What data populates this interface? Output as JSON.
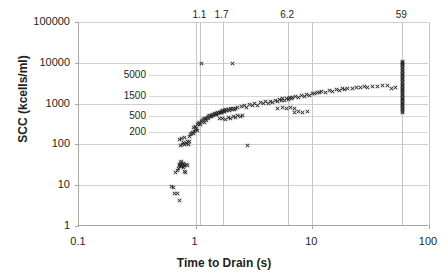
{
  "chart_data": {
    "type": "scatter",
    "title": "",
    "xlabel": "Time to Drain (s)",
    "ylabel": "SCC (kcells/ml)",
    "xscale": "log",
    "yscale": "log",
    "xlim": [
      0.1,
      100
    ],
    "ylim": [
      1,
      100000
    ],
    "grid": true,
    "legend": "none",
    "marker": "x",
    "marker_color": "#2b2b2b",
    "xticks": [
      "0.1",
      "1",
      "10",
      "100"
    ],
    "xtick_values": [
      0.1,
      1,
      10,
      100
    ],
    "yticks": [
      "1",
      "10",
      "100",
      "1000",
      "10000",
      "100000"
    ],
    "ytick_values": [
      1,
      10,
      100,
      1000,
      10000,
      100000
    ],
    "inner_y_reference_labels": [
      "200",
      "500",
      "1500",
      "5000"
    ],
    "inner_y_reference_values": [
      200,
      500,
      1500,
      5000
    ],
    "top_x_reference_labels": [
      "1.1",
      "1.7",
      "6.2",
      "59"
    ],
    "top_x_reference_values": [
      1.1,
      1.7,
      6.2,
      59
    ],
    "points": [
      [
        0.62,
        9.2
      ],
      [
        0.65,
        9.0
      ],
      [
        0.66,
        6.2
      ],
      [
        0.7,
        6.1
      ],
      [
        0.72,
        4.2
      ],
      [
        0.67,
        21.0
      ],
      [
        0.7,
        23.0
      ],
      [
        0.71,
        26.0
      ],
      [
        0.72,
        30.0
      ],
      [
        0.73,
        33.0
      ],
      [
        0.74,
        31.0
      ],
      [
        0.74,
        36.0
      ],
      [
        0.75,
        28.0
      ],
      [
        0.75,
        34.0
      ],
      [
        0.76,
        29.0
      ],
      [
        0.76,
        38.0
      ],
      [
        0.77,
        32.0
      ],
      [
        0.78,
        27.0
      ],
      [
        0.78,
        35.0
      ],
      [
        0.79,
        31.0
      ],
      [
        0.8,
        30.0
      ],
      [
        0.81,
        22.0
      ],
      [
        0.82,
        20.0
      ],
      [
        0.83,
        33.0
      ],
      [
        0.85,
        31.0
      ],
      [
        0.74,
        95.0
      ],
      [
        0.77,
        100.0
      ],
      [
        0.79,
        110.0
      ],
      [
        0.81,
        98.0
      ],
      [
        0.83,
        105.0
      ],
      [
        0.85,
        120.0
      ],
      [
        0.87,
        99.0
      ],
      [
        0.89,
        115.0
      ],
      [
        0.72,
        130.0
      ],
      [
        0.76,
        140.0
      ],
      [
        0.8,
        150.0
      ],
      [
        0.88,
        160.0
      ],
      [
        0.9,
        175.0
      ],
      [
        0.92,
        190.0
      ],
      [
        0.94,
        200.0
      ],
      [
        0.96,
        185.0
      ],
      [
        0.98,
        210.0
      ],
      [
        1.0,
        230.0
      ],
      [
        1.02,
        250.0
      ],
      [
        1.04,
        220.0
      ],
      [
        0.95,
        260.0
      ],
      [
        0.99,
        280.0
      ],
      [
        1.03,
        300.0
      ],
      [
        1.06,
        320.0
      ],
      [
        1.08,
        340.0
      ],
      [
        1.1,
        310.0
      ],
      [
        1.12,
        360.0
      ],
      [
        1.14,
        380.0
      ],
      [
        1.16,
        400.0
      ],
      [
        1.18,
        350.0
      ],
      [
        1.2,
        420.0
      ],
      [
        1.22,
        440.0
      ],
      [
        1.24,
        390.0
      ],
      [
        1.26,
        460.0
      ],
      [
        1.28,
        480.0
      ],
      [
        1.3,
        430.0
      ],
      [
        1.32,
        500.0
      ],
      [
        1.34,
        470.0
      ],
      [
        1.36,
        520.0
      ],
      [
        1.38,
        490.0
      ],
      [
        1.4,
        540.0
      ],
      [
        1.42,
        510.0
      ],
      [
        1.45,
        560.0
      ],
      [
        1.48,
        530.0
      ],
      [
        1.5,
        580.0
      ],
      [
        1.52,
        550.0
      ],
      [
        1.55,
        600.0
      ],
      [
        1.58,
        570.0
      ],
      [
        1.6,
        620.0
      ],
      [
        1.62,
        590.0
      ],
      [
        1.65,
        640.0
      ],
      [
        1.68,
        610.0
      ],
      [
        1.7,
        660.0
      ],
      [
        1.72,
        630.0
      ],
      [
        1.75,
        680.0
      ],
      [
        1.78,
        650.0
      ],
      [
        1.8,
        700.0
      ],
      [
        1.85,
        670.0
      ],
      [
        1.9,
        720.0
      ],
      [
        1.95,
        690.0
      ],
      [
        2.0,
        740.0
      ],
      [
        2.05,
        710.0
      ],
      [
        2.1,
        760.0
      ],
      [
        2.15,
        730.0
      ],
      [
        2.2,
        780.0
      ],
      [
        1.6,
        420.0
      ],
      [
        1.7,
        440.0
      ],
      [
        1.8,
        400.0
      ],
      [
        1.9,
        460.0
      ],
      [
        2.0,
        430.0
      ],
      [
        2.1,
        480.0
      ],
      [
        2.2,
        450.0
      ],
      [
        2.3,
        500.0
      ],
      [
        2.4,
        470.0
      ],
      [
        2.5,
        520.0
      ],
      [
        2.3,
        800.0
      ],
      [
        2.45,
        850.0
      ],
      [
        2.6,
        900.0
      ],
      [
        2.75,
        820.0
      ],
      [
        2.9,
        950.0
      ],
      [
        3.05,
        880.0
      ],
      [
        3.2,
        1000.0
      ],
      [
        3.4,
        920.0
      ],
      [
        3.6,
        1050.0
      ],
      [
        3.8,
        980.0
      ],
      [
        4.0,
        1100.0
      ],
      [
        4.2,
        1020.0
      ],
      [
        4.4,
        1150.0
      ],
      [
        4.6,
        1080.0
      ],
      [
        4.8,
        1200.0
      ],
      [
        5.0,
        1120.0
      ],
      [
        5.2,
        1250.0
      ],
      [
        5.4,
        1180.0
      ],
      [
        5.6,
        1300.0
      ],
      [
        5.8,
        1220.0
      ],
      [
        6.0,
        1350.0
      ],
      [
        6.2,
        1280.0
      ],
      [
        6.4,
        1400.0
      ],
      [
        6.6,
        1330.0
      ],
      [
        6.8,
        1450.0
      ],
      [
        5.0,
        760.0
      ],
      [
        5.5,
        800.0
      ],
      [
        6.0,
        740.0
      ],
      [
        6.5,
        820.0
      ],
      [
        7.0,
        780.0
      ],
      [
        7.2,
        1500.0
      ],
      [
        7.6,
        1420.0
      ],
      [
        8.0,
        1600.0
      ],
      [
        8.5,
        1520.0
      ],
      [
        9.0,
        1700.0
      ],
      [
        9.5,
        1620.0
      ],
      [
        10.0,
        1800.0
      ],
      [
        10.5,
        1720.0
      ],
      [
        11.0,
        1900.0
      ],
      [
        11.5,
        1820.0
      ],
      [
        12.0,
        2000.0
      ],
      [
        13.0,
        1920.0
      ],
      [
        14.0,
        2100.0
      ],
      [
        15.0,
        2020.0
      ],
      [
        16.0,
        2200.0
      ],
      [
        17.0,
        2120.0
      ],
      [
        18.0,
        2300.0
      ],
      [
        19.0,
        2220.0
      ],
      [
        20.0,
        2400.0
      ],
      [
        22.0,
        2320.0
      ],
      [
        24.0,
        2500.0
      ],
      [
        26.0,
        2420.0
      ],
      [
        28.0,
        2600.0
      ],
      [
        30.0,
        2520.0
      ],
      [
        33.0,
        2700.0
      ],
      [
        36.0,
        2620.0
      ],
      [
        40.0,
        2800.0
      ],
      [
        44.0,
        2720.0
      ],
      [
        48.0,
        2400.0
      ],
      [
        52.0,
        2450.0
      ],
      [
        2.05,
        9500.0
      ],
      [
        1.12,
        9800.0
      ],
      [
        2.8,
        95.0
      ],
      [
        7.0,
        620.0
      ],
      [
        7.6,
        640.0
      ],
      [
        8.3,
        610.0
      ],
      [
        9.1,
        650.0
      ],
      [
        59.0,
        7800.0
      ],
      [
        59.0,
        7200.0
      ],
      [
        59.0,
        6600.0
      ],
      [
        59.0,
        6100.0
      ],
      [
        59.0,
        5600.0
      ],
      [
        59.0,
        5200.0
      ],
      [
        59.0,
        4800.0
      ],
      [
        59.0,
        4400.0
      ],
      [
        59.0,
        4100.0
      ],
      [
        59.0,
        3800.0
      ],
      [
        59.0,
        3500.0
      ],
      [
        59.0,
        3200.0
      ],
      [
        59.0,
        3000.0
      ],
      [
        59.0,
        2800.0
      ],
      [
        59.0,
        2600.0
      ],
      [
        59.0,
        2400.0
      ],
      [
        59.0,
        2250.0
      ],
      [
        59.0,
        2100.0
      ],
      [
        59.0,
        1950.0
      ],
      [
        59.0,
        1800.0
      ],
      [
        59.0,
        1680.0
      ],
      [
        59.0,
        1560.0
      ],
      [
        59.0,
        1450.0
      ],
      [
        59.0,
        1350.0
      ],
      [
        59.0,
        1260.0
      ],
      [
        59.0,
        1170.0
      ],
      [
        59.0,
        1090.0
      ],
      [
        59.0,
        1020.0
      ],
      [
        59.0,
        950.0
      ],
      [
        59.0,
        880.0
      ],
      [
        59.0,
        820.0
      ],
      [
        59.0,
        760.0
      ],
      [
        59.0,
        8400.0
      ],
      [
        59.0,
        9000.0
      ],
      [
        59.0,
        9600.0
      ],
      [
        59.0,
        10200.0
      ],
      [
        59.0,
        11000.0
      ],
      [
        59.0,
        700.0
      ],
      [
        59.0,
        650.0
      ],
      [
        59.0,
        600.0
      ]
    ]
  }
}
